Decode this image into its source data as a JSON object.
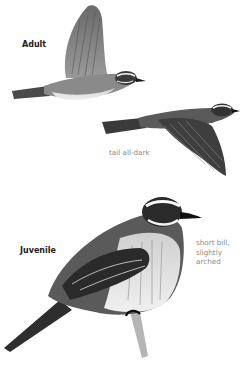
{
  "labels": {
    "adult": "Adult",
    "juvenile": "Juvenile"
  },
  "notes": {
    "tail": "tail all-dark",
    "bill_line1": "short bill,",
    "bill_line2": "slightly",
    "bill_line3": "arched"
  },
  "illustrations": [
    {
      "name": "adult-bird-flying-wings-up",
      "pose": "flight, wings raised"
    },
    {
      "name": "adult-bird-flying-wings-down",
      "pose": "flight, wings lowered"
    },
    {
      "name": "juvenile-bird-perched",
      "pose": "perched on branch"
    }
  ]
}
